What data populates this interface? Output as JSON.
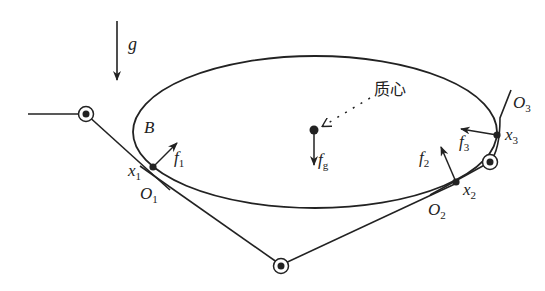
{
  "diagram": {
    "type": "free-body / contact diagram",
    "colors": {
      "stroke": "#222222",
      "background": "#ffffff"
    },
    "gravity": {
      "symbol": "g"
    },
    "body": {
      "symbol": "B"
    },
    "center_of_mass": {
      "label": "质心",
      "force_symbol": "f",
      "force_sub": "g"
    },
    "contacts": [
      {
        "point_symbol": "x",
        "point_sub": "1",
        "frame_symbol": "O",
        "frame_sub": "1",
        "force_symbol": "f",
        "force_sub": "1"
      },
      {
        "point_symbol": "x",
        "point_sub": "2",
        "frame_symbol": "O",
        "frame_sub": "2",
        "force_symbol": "f",
        "force_sub": "2"
      },
      {
        "point_symbol": "x",
        "point_sub": "3",
        "frame_symbol": "O",
        "frame_sub": "3",
        "force_symbol": "f",
        "force_sub": "3"
      }
    ],
    "joints": [
      "left-joint",
      "bottom-joint",
      "right-joint"
    ]
  }
}
